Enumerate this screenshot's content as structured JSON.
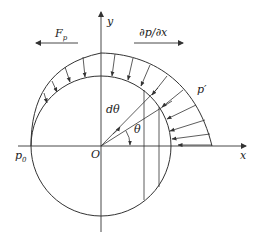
{
  "figure": {
    "colors": {
      "stroke": "#333333",
      "background": "#ffffff"
    },
    "labels": {
      "y_axis": "y",
      "x_axis": "x",
      "origin": "O",
      "force_pressure": "F",
      "force_pressure_sub": "p",
      "pressure_gradient": "∂p/∂x",
      "pressure_prime": "p′",
      "pressure_zero": "p",
      "pressure_zero_sub": "0",
      "angle_increment": "dθ",
      "angle": "θ"
    },
    "arrows": {
      "force_pressure_direction": "left",
      "pressure_gradient_direction": "right"
    }
  }
}
